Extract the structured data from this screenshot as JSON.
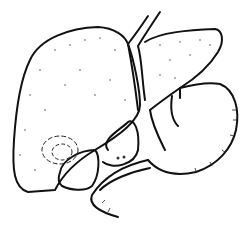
{
  "figure": {
    "type": "line-drawing",
    "colors": {
      "background": "#ffffff",
      "ink": "#111111"
    },
    "labels": []
  }
}
